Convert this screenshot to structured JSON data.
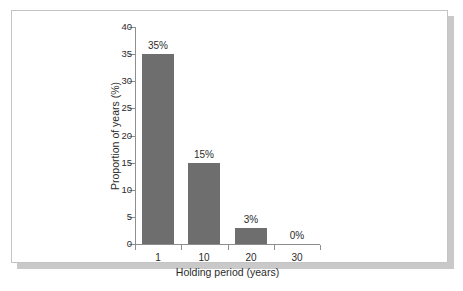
{
  "chart_data": {
    "type": "bar",
    "title": "",
    "subtitle": "",
    "xlabel": "Holding period (years)",
    "ylabel": "Proportion of years (%)",
    "categories": [
      "1",
      "10",
      "20",
      "30"
    ],
    "values": [
      35,
      15,
      3,
      0
    ],
    "data_labels": [
      "35%",
      "15%",
      "3%",
      "0%"
    ],
    "ylim": [
      0,
      40
    ],
    "yticks": [
      0,
      5,
      10,
      15,
      20,
      25,
      30,
      35,
      40
    ],
    "ytick_labels": [
      "0",
      "5",
      "10",
      "15",
      "20",
      "25",
      "30",
      "35",
      "40"
    ],
    "grid": false,
    "legend": "none",
    "bar_color": "#6e6e6e",
    "axis_color": "#8e8e8e",
    "text_color": "#2b2b2b",
    "frame_border_color": "#c4c4c4",
    "background_color": "#ffffff"
  }
}
